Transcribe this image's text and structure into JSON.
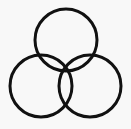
{
  "diagram": {
    "type": "three-circle-overlap",
    "background": "#f8f8f8",
    "stroke_color": "#111111",
    "stroke_width": 3,
    "circles": [
      {
        "id": "top",
        "cx": 66,
        "cy": 40,
        "r": 31
      },
      {
        "id": "left",
        "cx": 41,
        "cy": 86,
        "r": 31
      },
      {
        "id": "right",
        "cx": 90,
        "cy": 86,
        "r": 31
      }
    ]
  }
}
